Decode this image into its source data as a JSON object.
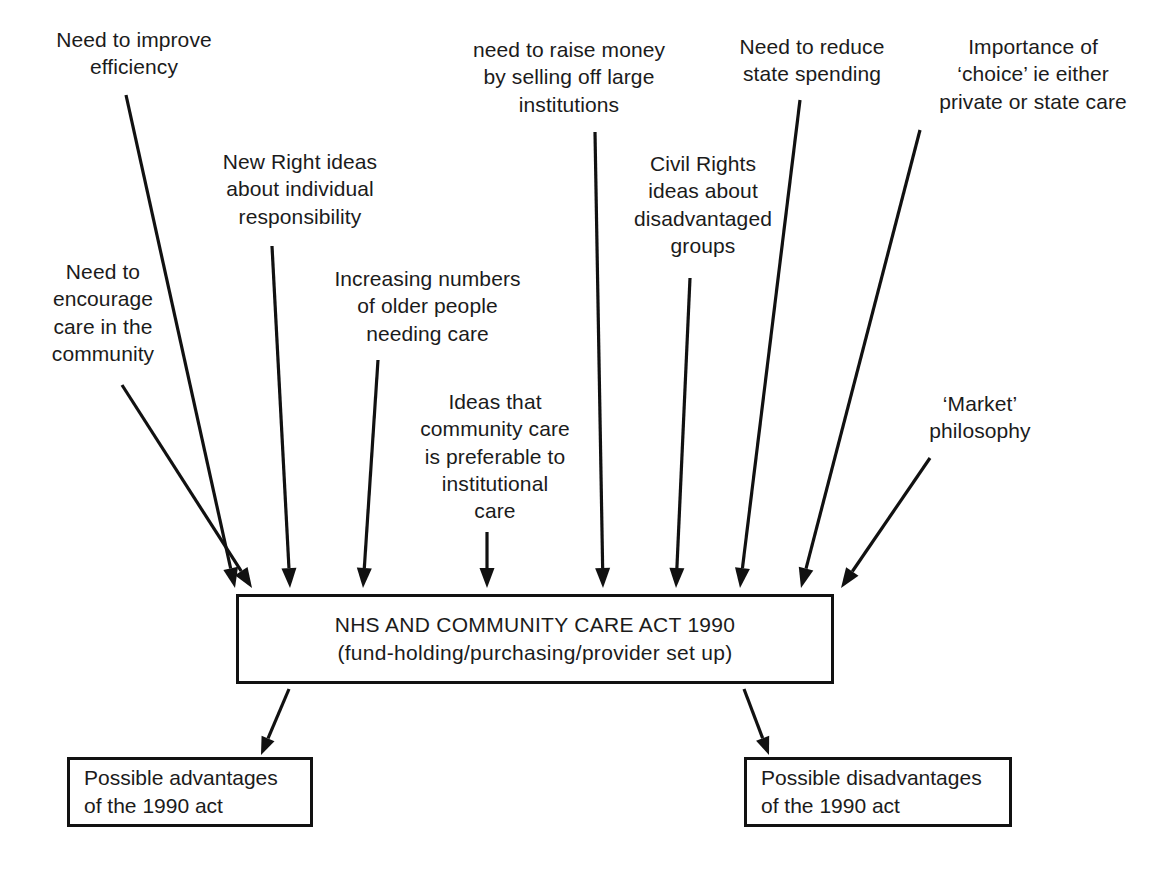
{
  "diagram": {
    "type": "influence-flow-diagram",
    "colors": {
      "line": "#111111",
      "text": "#1b1b1b",
      "background": "#ffffff"
    },
    "factors": [
      {
        "id": "improve-efficiency",
        "text": "Need to improve\nefficiency",
        "label_box": {
          "x": 24,
          "y": 26,
          "width": 220,
          "height": 62
        },
        "arrow": {
          "x1": 126,
          "y1": 95,
          "x2": 235,
          "y2": 588
        }
      },
      {
        "id": "new-right-ideas",
        "text": "New Right ideas\nabout individual\nresponsibility",
        "label_box": {
          "x": 205,
          "y": 148,
          "width": 190,
          "height": 92
        },
        "arrow": {
          "x1": 272,
          "y1": 246,
          "x2": 290,
          "y2": 588
        }
      },
      {
        "id": "encourage-care-community",
        "text": "Need to\nencourage\ncare in the\ncommunity",
        "label_box": {
          "x": 28,
          "y": 258,
          "width": 150,
          "height": 122
        },
        "arrow": {
          "x1": 122,
          "y1": 385,
          "x2": 252,
          "y2": 588
        }
      },
      {
        "id": "increasing-older-people",
        "text": "Increasing numbers\nof older people\nneeding care",
        "label_box": {
          "x": 320,
          "y": 265,
          "width": 215,
          "height": 92
        },
        "arrow": {
          "x1": 378,
          "y1": 360,
          "x2": 363,
          "y2": 588
        }
      },
      {
        "id": "community-care-preferable",
        "text": "Ideas that\ncommunity care\nis preferable to\ninstitutional\ncare",
        "label_box": {
          "x": 400,
          "y": 388,
          "width": 190,
          "height": 152
        },
        "arrow": {
          "x1": 487,
          "y1": 532,
          "x2": 487,
          "y2": 588
        }
      },
      {
        "id": "raise-money-selling-institutions",
        "text": "need to raise money\nby selling off large\ninstitutions",
        "label_box": {
          "x": 455,
          "y": 36,
          "width": 228,
          "height": 92
        },
        "arrow": {
          "x1": 595,
          "y1": 132,
          "x2": 603,
          "y2": 588
        }
      },
      {
        "id": "civil-rights-disadvantaged",
        "text": "Civil Rights\nideas about\ndisadvantaged\ngroups",
        "label_box": {
          "x": 618,
          "y": 150,
          "width": 170,
          "height": 122
        },
        "arrow": {
          "x1": 690,
          "y1": 278,
          "x2": 676,
          "y2": 588
        }
      },
      {
        "id": "reduce-state-spending",
        "text": "Need to reduce\nstate spending",
        "label_box": {
          "x": 722,
          "y": 33,
          "width": 180,
          "height": 62
        },
        "arrow": {
          "x1": 800,
          "y1": 100,
          "x2": 740,
          "y2": 588
        }
      },
      {
        "id": "importance-of-choice",
        "text": "Importance of\n‘choice’ ie either\nprivate or state care",
        "label_box": {
          "x": 922,
          "y": 33,
          "width": 222,
          "height": 92
        },
        "arrow": {
          "x1": 920,
          "y1": 130,
          "x2": 801,
          "y2": 588
        }
      },
      {
        "id": "market-philosophy",
        "text": "‘Market’\nphilosophy",
        "label_box": {
          "x": 900,
          "y": 390,
          "width": 160,
          "height": 62
        },
        "arrow": {
          "x1": 930,
          "y1": 458,
          "x2": 841,
          "y2": 588
        }
      }
    ],
    "act_box": {
      "id": "nhs-community-care-act",
      "line1": "NHS AND COMMUNITY CARE ACT 1990",
      "line2": "(fund-holding/purchasing/provider set up)",
      "box": {
        "x": 236,
        "y": 594,
        "width": 598,
        "height": 90
      }
    },
    "outcomes": [
      {
        "id": "possible-advantages",
        "text": "Possible advantages\nof the 1990 act",
        "box": {
          "x": 67,
          "y": 757,
          "width": 246,
          "height": 70
        },
        "arrow": {
          "x1": 289,
          "y1": 689,
          "x2": 261,
          "y2": 755
        }
      },
      {
        "id": "possible-disadvantages",
        "text": "Possible disadvantages\nof the 1990 act",
        "box": {
          "x": 744,
          "y": 757,
          "width": 268,
          "height": 70
        },
        "arrow": {
          "x1": 744,
          "y1": 689,
          "x2": 769,
          "y2": 755
        }
      }
    ]
  }
}
